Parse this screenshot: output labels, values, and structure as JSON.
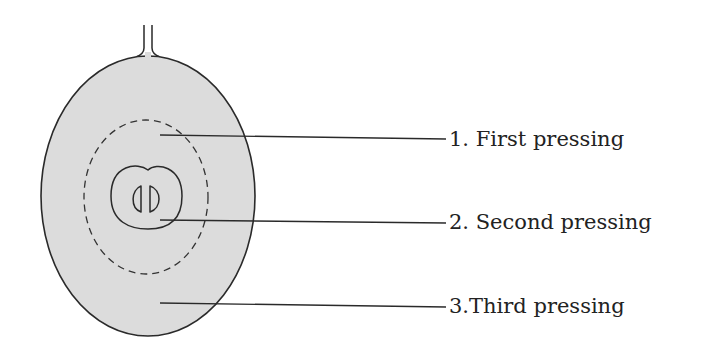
{
  "diagram": {
    "colors": {
      "fill": "#dcdcdc",
      "stroke": "#2a2a2a",
      "background": "#ffffff"
    },
    "labels": [
      {
        "id": "first",
        "text": "1. First pressing",
        "region": "outer flesh near skin-inner boundary (dashed zone)"
      },
      {
        "id": "second",
        "text": "2. Second pressing",
        "region": "around seeds"
      },
      {
        "id": "third",
        "text": "3.Third pressing",
        "region": "near skin"
      }
    ],
    "parts": [
      "stem",
      "skin",
      "first-pressing-zone",
      "seed-core",
      "pips"
    ]
  }
}
